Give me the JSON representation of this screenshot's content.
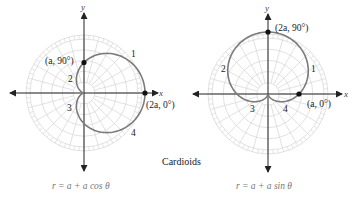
{
  "figure": {
    "caption": "Cardioids",
    "colors": {
      "curve": "#7a7a7a",
      "grid": "#d4d4d4",
      "axis": "#222222",
      "point": "#111111"
    },
    "left": {
      "equation": "r = a + a cos θ",
      "axis_labels": {
        "x": "x",
        "y": "y"
      },
      "points": [
        {
          "label": "(a, 90°)",
          "r": "a",
          "theta": "90°"
        },
        {
          "label": "(2a, 0°)",
          "r": "2a",
          "theta": "0°"
        }
      ],
      "quadrant_labels": [
        "1",
        "2",
        "3",
        "4"
      ]
    },
    "right": {
      "equation": "r = a + a sin θ",
      "axis_labels": {
        "x": "x",
        "y": "y"
      },
      "points": [
        {
          "label": "(2a, 90°)",
          "r": "2a",
          "theta": "90°"
        },
        {
          "label": "(a, 0°)",
          "r": "a",
          "theta": "0°"
        }
      ],
      "quadrant_labels": [
        "1",
        "2",
        "3",
        "4"
      ]
    }
  }
}
